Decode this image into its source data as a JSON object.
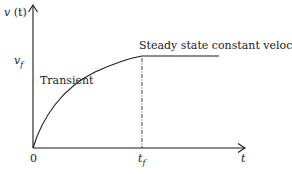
{
  "diagram": {
    "y_axis_label": {
      "var": "v",
      "arg": "(t)"
    },
    "x_axis_label": "t",
    "origin_label": "0",
    "vf_label": {
      "base": "v",
      "sub": "f"
    },
    "tf_label": {
      "base": "t",
      "sub": "f"
    },
    "transient_label": "Transient",
    "steady_label": "Steady state constant velocity = ",
    "steady_symbol": "V",
    "colors": {
      "line": "#1a1a1a",
      "background": "#ffffff"
    }
  }
}
